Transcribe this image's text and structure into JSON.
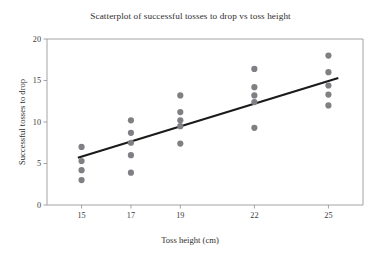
{
  "chart_data": {
    "type": "scatter",
    "title": "Scatterplot of successful tosses to drop vs toss height",
    "xlabel": "Toss height (cm)",
    "ylabel": "Successful tosses to drop",
    "xlim": [
      13.6,
      26.4
    ],
    "ylim": [
      0,
      20
    ],
    "xticks": [
      15,
      17,
      19,
      22,
      25
    ],
    "xtick_labels": [
      "15",
      "17",
      "19",
      "22",
      "25"
    ],
    "yticks": [
      0,
      5,
      10,
      15,
      20
    ],
    "ytick_labels": [
      "0",
      "5",
      "10",
      "15",
      "20"
    ],
    "grid": false,
    "legend": "none",
    "marker_color": "#808084",
    "marker_size": 3.1,
    "line_color": "#1a1a1a",
    "axis_color": "#9a9a9a",
    "points": [
      {
        "x": 15,
        "y": 7.0
      },
      {
        "x": 15,
        "y": 5.3
      },
      {
        "x": 15,
        "y": 4.2
      },
      {
        "x": 15,
        "y": 3.0
      },
      {
        "x": 17,
        "y": 10.2
      },
      {
        "x": 17,
        "y": 8.7
      },
      {
        "x": 17,
        "y": 7.5
      },
      {
        "x": 17,
        "y": 6.0
      },
      {
        "x": 17,
        "y": 3.9
      },
      {
        "x": 19,
        "y": 13.2
      },
      {
        "x": 19,
        "y": 11.2
      },
      {
        "x": 19,
        "y": 10.2
      },
      {
        "x": 19,
        "y": 9.5
      },
      {
        "x": 19,
        "y": 7.4
      },
      {
        "x": 22,
        "y": 16.4
      },
      {
        "x": 22,
        "y": 14.2
      },
      {
        "x": 22,
        "y": 13.2
      },
      {
        "x": 22,
        "y": 12.4
      },
      {
        "x": 22,
        "y": 9.3
      },
      {
        "x": 25,
        "y": 18.0
      },
      {
        "x": 25,
        "y": 16.0
      },
      {
        "x": 25,
        "y": 14.4
      },
      {
        "x": 25,
        "y": 13.3
      },
      {
        "x": 25,
        "y": 12.0
      }
    ],
    "trendline": {
      "x_start": 14.85,
      "y_start": 5.7,
      "x_end": 25.4,
      "y_end": 15.3
    }
  }
}
